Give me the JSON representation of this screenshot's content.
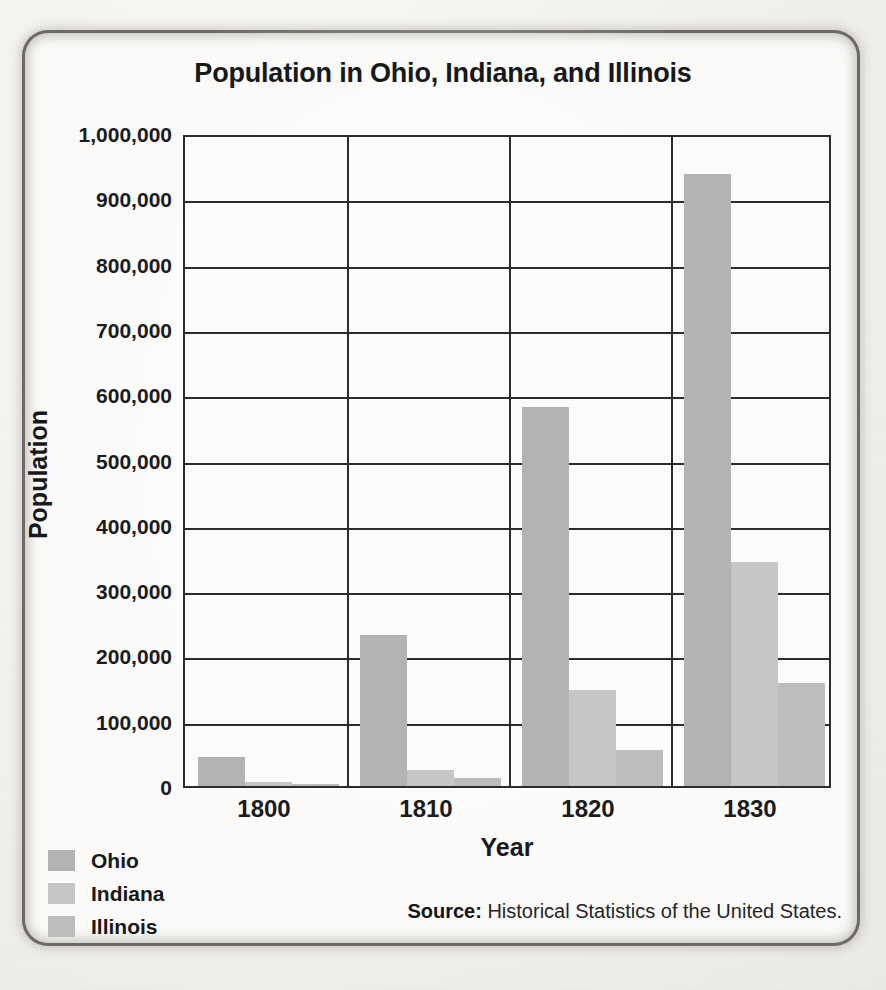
{
  "chart_data": {
    "type": "bar",
    "title": "Population in Ohio, Indiana, and Illinois",
    "xlabel": "Year",
    "ylabel": "Population",
    "categories": [
      "1800",
      "1810",
      "1820",
      "1830"
    ],
    "series": [
      {
        "name": "Ohio",
        "color": "#b3b3b3",
        "values": [
          45000,
          231000,
          581000,
          938000
        ]
      },
      {
        "name": "Indiana",
        "color": "#c6c6c6",
        "values": [
          5600,
          24500,
          147000,
          343000
        ]
      },
      {
        "name": "Illinois",
        "color": "#bdbdbd",
        "values": [
          2500,
          12300,
          55000,
          157000
        ]
      }
    ],
    "ylim": [
      0,
      1000000
    ],
    "ytick_values": [
      0,
      100000,
      200000,
      300000,
      400000,
      500000,
      600000,
      700000,
      800000,
      900000,
      1000000
    ],
    "ytick_labels": [
      "0",
      "100,000",
      "200,000",
      "300,000",
      "400,000",
      "500,000",
      "600,000",
      "700,000",
      "800,000",
      "900,000",
      "1,000,000"
    ],
    "grid": true,
    "legend_position": "bottom-left"
  },
  "source": {
    "prefix": "Source:",
    "text": "Historical Statistics of the United States."
  }
}
